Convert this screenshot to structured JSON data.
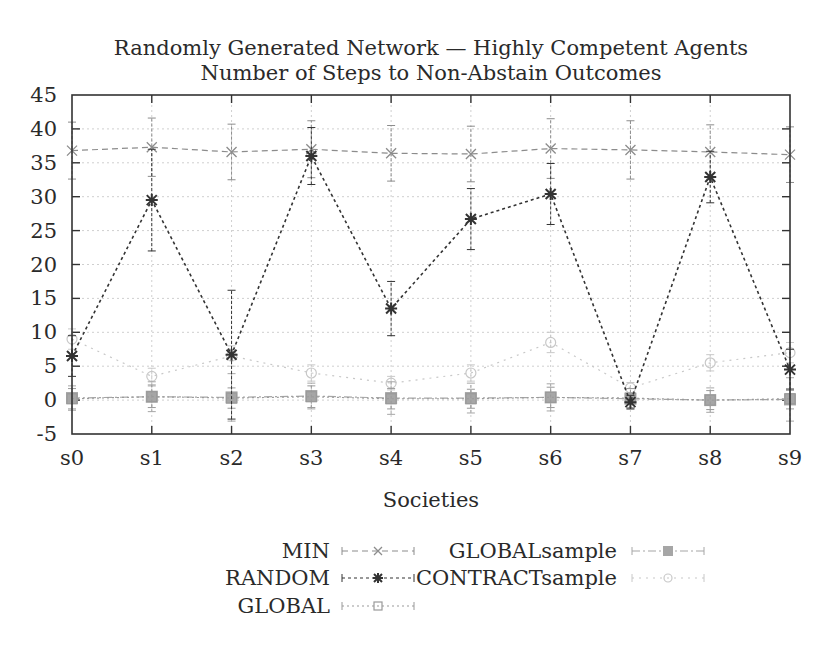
{
  "chart_data": {
    "type": "line",
    "title": "Randomly Generated Network — Highly Competent Agents",
    "subtitle": "Number of Steps to Non-Abstain Outcomes",
    "xlabel": "Societies",
    "ylabel": "",
    "categories": [
      "s0",
      "s1",
      "s2",
      "s3",
      "s4",
      "s5",
      "s6",
      "s7",
      "s8",
      "s9"
    ],
    "ylim": [
      -5,
      45
    ],
    "yticks": [
      -5,
      0,
      5,
      10,
      15,
      20,
      25,
      30,
      35,
      40,
      45
    ],
    "grid": true,
    "legend_position": "bottom",
    "error_bars": true,
    "series": [
      {
        "name": "MIN",
        "marker": "x",
        "dash": "6,4",
        "color": "#8c8c8c",
        "values": [
          36.8,
          37.3,
          36.6,
          37.0,
          36.4,
          36.3,
          37.1,
          36.9,
          36.6,
          36.2
        ],
        "err": [
          4.2,
          4.3,
          4.1,
          4.2,
          4.1,
          4.1,
          4.4,
          4.3,
          4.0,
          4.1
        ]
      },
      {
        "name": "RANDOM",
        "marker": "star",
        "dash": "3,3",
        "color": "#333333",
        "values": [
          6.5,
          29.5,
          6.7,
          36.0,
          13.5,
          26.7,
          30.4,
          -0.3,
          32.9,
          4.5
        ],
        "err": [
          3.0,
          7.5,
          9.5,
          4.2,
          4.0,
          4.5,
          4.5,
          1.0,
          3.8,
          3.0
        ]
      },
      {
        "name": "GLOBAL",
        "marker": "square-open",
        "dash": "2,3",
        "color": "#9a9a9a",
        "values": [
          0.2,
          0.5,
          0.3,
          0.5,
          0.2,
          0.2,
          0.4,
          0.3,
          0.0,
          0.2
        ],
        "err": [
          1.5,
          1.6,
          1.5,
          1.6,
          1.5,
          1.4,
          1.5,
          1.4,
          1.4,
          1.5
        ]
      },
      {
        "name": "GLOBALsample",
        "marker": "square-filled",
        "dash": "8,3,2,3",
        "color": "#a6a6a6",
        "values": [
          0.3,
          0.5,
          0.4,
          0.6,
          0.3,
          0.3,
          0.4,
          0.2,
          0.0,
          0.1
        ],
        "err": [
          1.8,
          2.2,
          3.5,
          1.9,
          2.4,
          2.2,
          2.0,
          1.5,
          1.8,
          3.2
        ]
      },
      {
        "name": "CONTRACTsample",
        "marker": "circle-open",
        "dash": "2,5",
        "color": "#c8c8c8",
        "values": [
          9.0,
          3.5,
          6.5,
          4.0,
          2.5,
          4.0,
          8.5,
          1.8,
          5.5,
          7.0
        ],
        "err": [
          1.5,
          1.2,
          1.5,
          1.2,
          1.0,
          1.2,
          1.5,
          0.8,
          1.2,
          1.5
        ]
      }
    ]
  }
}
